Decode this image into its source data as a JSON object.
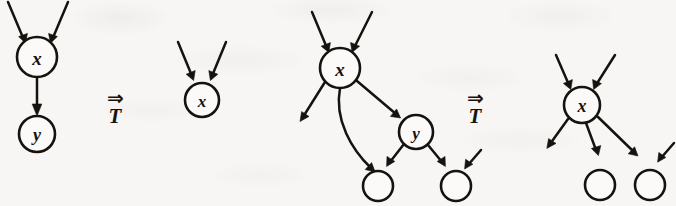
{
  "figure": {
    "kind": "graph-rewriting-rule-diagram",
    "background_color": "#f7f6f4",
    "ink_color": "#16130f",
    "panels": [
      {
        "id": "panel-1",
        "role": "left-hand-side-of-first-rule",
        "nodes": [
          {
            "id": "n1-x",
            "label": "x",
            "cx": 37,
            "cy": 57,
            "r": 20
          },
          {
            "id": "n1-y",
            "label": "y",
            "cx": 37,
            "cy": 134,
            "r": 18
          }
        ],
        "dangling_in_edges": 2,
        "dangling_out_edges": 0,
        "internal_edges": [
          {
            "from": "n1-x",
            "to": "n1-y"
          }
        ]
      },
      {
        "id": "panel-2",
        "role": "right-hand-side-of-first-rule",
        "nodes": [
          {
            "id": "n2-x",
            "label": "x",
            "cx": 202,
            "cy": 100,
            "r": 17
          }
        ],
        "dangling_in_edges": 2,
        "dangling_out_edges": 0,
        "internal_edges": []
      },
      {
        "id": "panel-3",
        "role": "left-hand-side-of-second-rule",
        "nodes": [
          {
            "id": "n3-x",
            "label": "x",
            "cx": 340,
            "cy": 68,
            "r": 20
          },
          {
            "id": "n3-y",
            "label": "y",
            "cx": 416,
            "cy": 132,
            "r": 17
          },
          {
            "id": "n3-c1",
            "label": "",
            "cx": 378,
            "cy": 186,
            "r": 15
          },
          {
            "id": "n3-c2",
            "label": "",
            "cx": 456,
            "cy": 186,
            "r": 15
          }
        ],
        "dangling_in_edges": 2,
        "dangling_out_edges": 1,
        "internal_edges": [
          {
            "from": "n3-x",
            "to": "n3-y"
          },
          {
            "from": "n3-x",
            "to": "n3-c1",
            "curved": true
          },
          {
            "from": "n3-y",
            "to": "n3-c1"
          },
          {
            "from": "n3-y",
            "to": "n3-c2"
          }
        ]
      },
      {
        "id": "panel-4",
        "role": "right-hand-side-of-second-rule",
        "nodes": [
          {
            "id": "n4-x",
            "label": "x",
            "cx": 582,
            "cy": 105,
            "r": 18
          },
          {
            "id": "n4-c1",
            "label": "",
            "cx": 600,
            "cy": 185,
            "r": 15
          },
          {
            "id": "n4-c2",
            "label": "",
            "cx": 650,
            "cy": 185,
            "r": 15
          }
        ],
        "dangling_in_edges": 2,
        "dangling_out_edges": 1,
        "internal_edges": [
          {
            "from": "n4-x",
            "to": "n4-c1"
          },
          {
            "from": "n4-x",
            "to": "n4-c2"
          }
        ],
        "extra_dangling_in_on": "n4-c2"
      }
    ],
    "rule_symbols": [
      {
        "id": "rule-1",
        "arrow": "⇒",
        "subscript": "T",
        "x": 98,
        "y": 88
      },
      {
        "id": "rule-2",
        "arrow": "⇒",
        "subscript": "T",
        "x": 458,
        "y": 88
      }
    ],
    "labels": {
      "x": "x",
      "y": "y",
      "transform": "T",
      "double_arrow": "⇒"
    }
  }
}
